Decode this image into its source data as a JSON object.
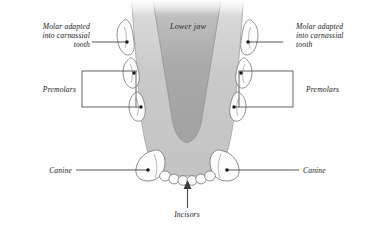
{
  "figure": {
    "background_color": "#fefefe",
    "jaw_outer_color": "#c9c9c9",
    "jaw_inner_color": "#a9a9a9",
    "tooth_fill_color": "#fdfdfd",
    "outline_color": "#6e6e6e",
    "leader_color": "#3a3a3a",
    "text_color": "#1a1a1a"
  },
  "labels": {
    "lower_jaw": "Lower jaw",
    "molar_left": "Molar adapted\ninto carnassial\ntooth",
    "molar_right": "Molar adapted\ninto carnassial\ntooth",
    "premolars_left": "Premolars",
    "premolars_right": "Premolars",
    "canine_left": "Canine",
    "canine_right": "Canine",
    "incisors": "Incisors"
  },
  "teeth": {
    "incisor_count": 6,
    "canine_count": 2,
    "premolar_count_per_side": 2,
    "molar_count_per_side": 1
  },
  "annotations": {
    "premolar_bracket_shape": "rectangle",
    "incisor_pointer_shape": "arrow-up",
    "molar_pointer_shape": "line-with-dot",
    "canine_pointer_shape": "line-with-dot"
  }
}
